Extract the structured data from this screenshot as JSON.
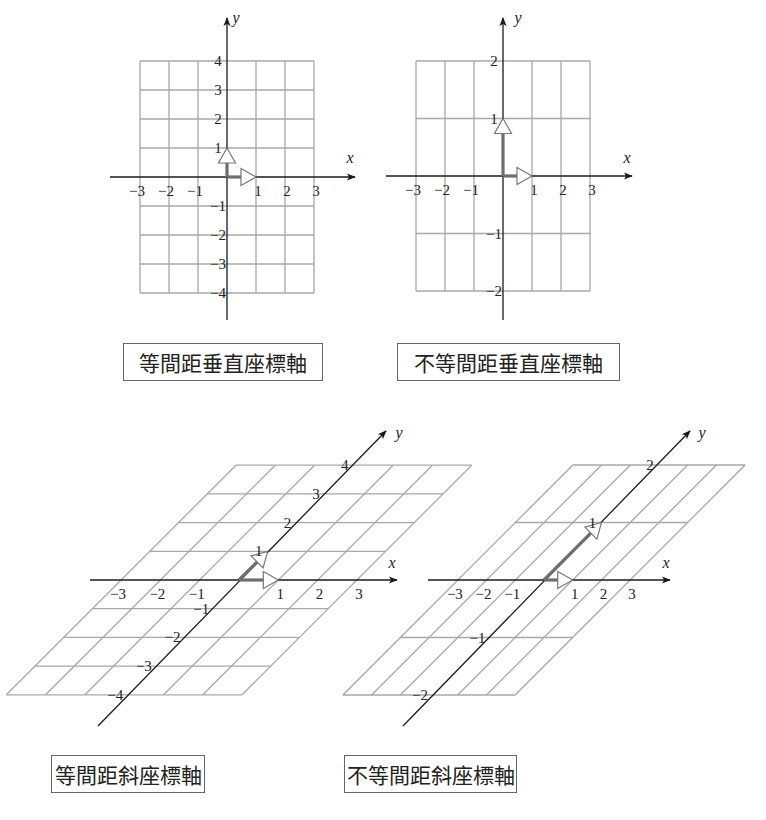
{
  "figure": {
    "panels": [
      {
        "id": "equal-rect",
        "caption": "等間距垂直座標軸",
        "x_axis_label": "x",
        "y_axis_label": "y",
        "x_ticks": [
          "-3",
          "-2",
          "-1",
          "1",
          "2",
          "3"
        ],
        "y_ticks": [
          "4",
          "3",
          "2",
          "1",
          "-1",
          "-2",
          "-3",
          "-4"
        ]
      },
      {
        "id": "unequal-rect",
        "caption": "不等間距垂直座標軸",
        "x_axis_label": "x",
        "y_axis_label": "y",
        "x_ticks": [
          "-3",
          "-2",
          "-1",
          "1",
          "2",
          "3"
        ],
        "y_ticks": [
          "2",
          "1",
          "-1",
          "-2"
        ]
      },
      {
        "id": "equal-oblique",
        "caption": "等間距斜座標軸",
        "x_axis_label": "x",
        "y_axis_label": "y",
        "x_ticks": [
          "-3",
          "-2",
          "-1",
          "1",
          "2",
          "3"
        ],
        "y_ticks": [
          "4",
          "3",
          "2",
          "1",
          "-1",
          "-2",
          "-3",
          "-4"
        ]
      },
      {
        "id": "unequal-oblique",
        "caption": "不等間距斜座標軸",
        "x_axis_label": "x",
        "y_axis_label": "y",
        "x_ticks": [
          "-3",
          "-2",
          "-1",
          "1",
          "2",
          "3"
        ],
        "y_ticks": [
          "2",
          "1",
          "-1",
          "-2"
        ]
      }
    ],
    "colors": {
      "grid": "#a8a8a8",
      "axis": "#1a1a1a",
      "basis_vector": "#6e6e6e",
      "arrowhead_fill": "#ffffff"
    }
  }
}
